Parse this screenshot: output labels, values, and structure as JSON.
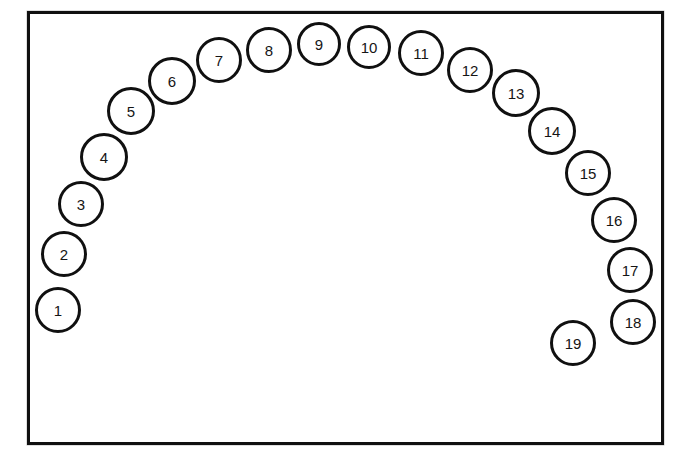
{
  "diagram": {
    "type": "arch-layout",
    "background_color": "#ffffff",
    "stroke_color": "#101010",
    "fill_color": "#ffffff",
    "label_color": "#151515",
    "frame": {
      "x": 27,
      "y": 11,
      "width": 637,
      "height": 434,
      "border_width": 3
    },
    "node_defaults": {
      "radius": 23,
      "border_width": 3
    },
    "nodes": [
      {
        "label": "1",
        "cx": 58,
        "cy": 310,
        "r": 23
      },
      {
        "label": "2",
        "cx": 64,
        "cy": 254,
        "r": 23
      },
      {
        "label": "3",
        "cx": 81,
        "cy": 204,
        "r": 23
      },
      {
        "label": "4",
        "cx": 104,
        "cy": 157,
        "r": 24
      },
      {
        "label": "5",
        "cx": 131,
        "cy": 111,
        "r": 24
      },
      {
        "label": "6",
        "cx": 172,
        "cy": 81,
        "r": 24
      },
      {
        "label": "7",
        "cx": 219,
        "cy": 60,
        "r": 23
      },
      {
        "label": "8",
        "cx": 269,
        "cy": 50,
        "r": 23
      },
      {
        "label": "9",
        "cx": 319,
        "cy": 44,
        "r": 22
      },
      {
        "label": "10",
        "cx": 369,
        "cy": 47,
        "r": 22
      },
      {
        "label": "11",
        "cx": 421,
        "cy": 53,
        "r": 23
      },
      {
        "label": "12",
        "cx": 470,
        "cy": 70,
        "r": 23
      },
      {
        "label": "13",
        "cx": 516,
        "cy": 93,
        "r": 24
      },
      {
        "label": "14",
        "cx": 552,
        "cy": 131,
        "r": 24
      },
      {
        "label": "15",
        "cx": 588,
        "cy": 173,
        "r": 23
      },
      {
        "label": "16",
        "cx": 614,
        "cy": 220,
        "r": 23
      },
      {
        "label": "17",
        "cx": 630,
        "cy": 270,
        "r": 23
      },
      {
        "label": "18",
        "cx": 633,
        "cy": 322,
        "r": 23
      },
      {
        "label": "19",
        "cx": 573,
        "cy": 343,
        "r": 23
      }
    ]
  }
}
